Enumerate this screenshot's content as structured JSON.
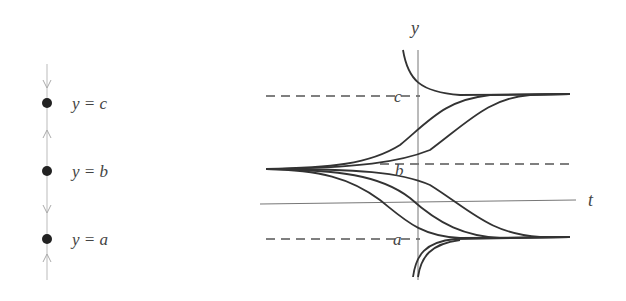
{
  "phase_line": {
    "equilibria": [
      {
        "label": "y = c",
        "name": "c",
        "stability": "stable"
      },
      {
        "label": "y = b",
        "name": "b",
        "stability": "unstable"
      },
      {
        "label": "y = a",
        "name": "a",
        "stability": "stable"
      }
    ],
    "arrows": [
      "down",
      "up",
      "down",
      "up"
    ]
  },
  "graph": {
    "y_axis_label": "y",
    "t_axis_label": "t",
    "equilibrium_labels": {
      "c": "c",
      "b": "b",
      "a": "a"
    },
    "line_color": "#333333",
    "axis_color": "#777777"
  }
}
